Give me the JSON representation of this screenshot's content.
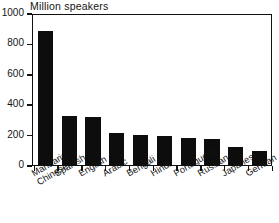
{
  "chart_data": {
    "type": "bar",
    "title": "Million speakers",
    "xlabel": "",
    "ylabel": "",
    "ylim": [
      0,
      1000
    ],
    "grid": false,
    "legend": "none",
    "annotation": "Source: SIL",
    "yticks": [
      0,
      200,
      400,
      600,
      800,
      1000
    ],
    "ytick_labels": [
      "0",
      "200",
      "400",
      "600",
      "800",
      "1000"
    ],
    "categories": [
      "Mandarin Chinese",
      "Spanish",
      "English",
      "Arabic",
      "Bengali",
      "Hindi",
      "Portuguese",
      "Russian",
      "Japanese",
      "German"
    ],
    "category_lines": [
      [
        "Mandarin",
        "Chinese"
      ],
      [
        "Spanish",
        ""
      ],
      [
        "English",
        ""
      ],
      [
        "Arabic",
        ""
      ],
      [
        "Bengali",
        ""
      ],
      [
        "Hindi",
        ""
      ],
      [
        "Portuguese",
        ""
      ],
      [
        "Russian",
        ""
      ],
      [
        "Japanese",
        ""
      ],
      [
        "German",
        ""
      ]
    ],
    "values": [
      885,
      332,
      322,
      220,
      205,
      196,
      182,
      181,
      125,
      98
    ],
    "bar_color": "#0d0d0d"
  }
}
